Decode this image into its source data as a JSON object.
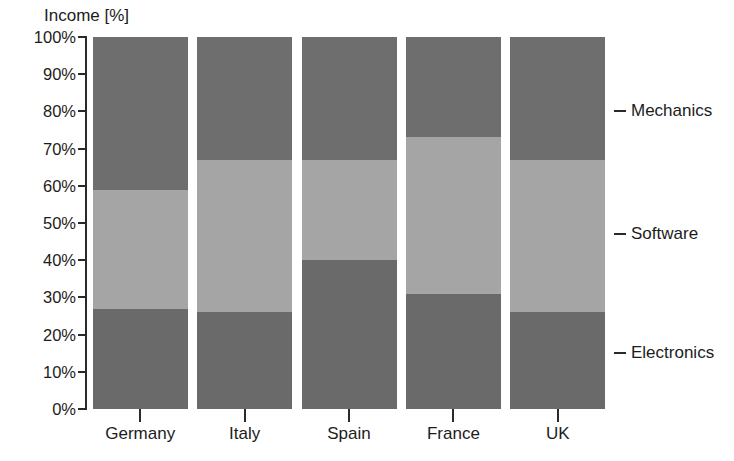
{
  "chart_data": {
    "type": "bar",
    "subtype": "stacked-bar-100pct",
    "title": "",
    "xlabel": "",
    "ylabel": "Income [%]",
    "ylim": [
      0,
      100
    ],
    "ytick_labels": [
      "100%",
      "90%",
      "80%",
      "70%",
      "60%",
      "50%",
      "40%",
      "30%",
      "20%",
      "10%",
      "0%"
    ],
    "ytick_values": [
      100,
      90,
      80,
      70,
      60,
      50,
      40,
      30,
      20,
      10,
      0
    ],
    "grid": false,
    "legend_position": "right-inline",
    "categories": [
      "Germany",
      "Italy",
      "Spain",
      "France",
      "UK"
    ],
    "series": [
      {
        "name": "Electronics",
        "color": "#6a6a6a",
        "values": [
          27,
          26,
          40,
          31,
          26
        ]
      },
      {
        "name": "Software",
        "color": "#a5a5a5",
        "values": [
          32,
          41,
          27,
          42,
          41
        ]
      },
      {
        "name": "Mechanics",
        "color": "#6e6e6e",
        "values": [
          41,
          33,
          33,
          27,
          33
        ]
      }
    ],
    "series_label_positions": [
      {
        "name": "Mechanics",
        "at_percent": 80
      },
      {
        "name": "Software",
        "at_percent": 47
      },
      {
        "name": "Electronics",
        "at_percent": 15
      }
    ]
  },
  "axis": {
    "y_title": "Income [%]"
  },
  "partial_title": "",
  "colors": {
    "mechanics": "#6e6e6e",
    "software": "#a5a5a5",
    "electronics": "#6a6a6a",
    "axis": "#2a2a2a",
    "text": "#1c1c1c",
    "background": "#ffffff"
  }
}
